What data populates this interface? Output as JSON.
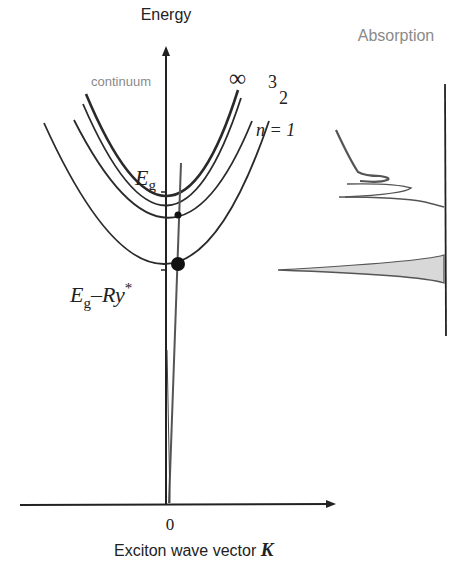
{
  "diagram": {
    "labels": {
      "y_axis": "Energy",
      "x_axis": "Exciton wave vector",
      "x_axis_symbol": "K",
      "x_origin": "0",
      "absorption": "Absorption",
      "continuum": "continuum",
      "infinity": "∞",
      "n3": "3",
      "n2": "2",
      "n1": "n = 1",
      "eg_main": "E",
      "eg_sub": "g",
      "eg_ry_main": "E",
      "eg_ry_sub": "g",
      "eg_ry_rest": "–Ry",
      "eg_ry_sup": "*"
    },
    "bands": [
      {
        "name": "continuum",
        "min_y": 198
      },
      {
        "name": "n=3",
        "min_y": 203
      },
      {
        "name": "n=2",
        "min_y": 218
      },
      {
        "name": "n=1",
        "min_y": 265
      }
    ],
    "colors": {
      "ink": "#222222",
      "gray_text": "#8a8a8a",
      "photon_line": "#666666",
      "shade": "#cfcfcf"
    }
  }
}
